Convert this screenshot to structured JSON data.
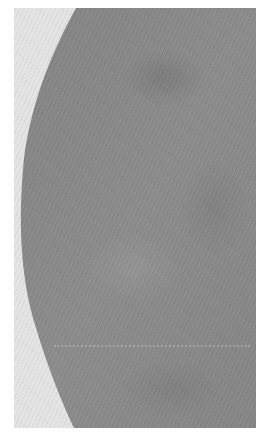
{
  "image": {
    "description": "Grayscale textured tissue region with curved left boundary against light background",
    "colors": {
      "border": "#ffffff",
      "background": "#e4e4e4",
      "tissue": "#8a8a8a",
      "tissue_dark": "#7c7c7c"
    }
  }
}
